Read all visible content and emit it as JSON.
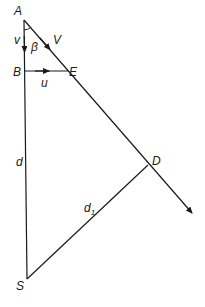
{
  "diagram": {
    "points": {
      "A": {
        "label": "A",
        "x": 24,
        "y": 20
      },
      "B": {
        "label": "B",
        "x": 25,
        "y": 71
      },
      "E": {
        "label": "E",
        "x": 68,
        "y": 71
      },
      "D": {
        "label": "D",
        "x": 148,
        "y": 165
      },
      "S": {
        "label": "S",
        "x": 27,
        "y": 279
      }
    },
    "labels": {
      "v": "v",
      "beta": "β",
      "V": "V",
      "u": "u",
      "d": "d",
      "d1_main": "d",
      "d1_sub": "1"
    },
    "colors": {
      "stroke": "#1a1a1a",
      "background": "#ffffff"
    }
  }
}
